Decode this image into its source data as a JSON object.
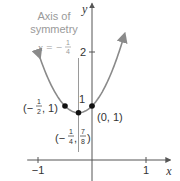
{
  "chart_data": {
    "type": "line",
    "title": "",
    "function": "y = 2x^2 + x + 1",
    "coefficients": {
      "a": 2,
      "b": 1,
      "c": 1
    },
    "xlabel": "x",
    "ylabel": "y",
    "xlim": [
      -1.2,
      1.45
    ],
    "ylim": [
      0,
      2.9
    ],
    "x_ticks": [
      {
        "value": -1,
        "label": "−1"
      },
      {
        "value": 1,
        "label": "1"
      }
    ],
    "y_ticks": [
      {
        "value": 1,
        "label": "1"
      },
      {
        "value": 2,
        "label": "2"
      }
    ],
    "curve_domain": [
      -0.97,
      0.6
    ],
    "grid": false,
    "axis_of_symmetry": {
      "x": -0.25,
      "title_line1": "Axis of",
      "title_line2": "symmetry",
      "equation_prefix": "x = −",
      "equation_num": "1",
      "equation_den": "4"
    },
    "points": [
      {
        "x": -0.5,
        "y": 1,
        "label_prefix": "(−",
        "num": "1",
        "den": "2",
        "label_suffix": ", 1)"
      },
      {
        "x": -0.25,
        "y": 0.875,
        "label_prefix": "(−",
        "num": "1",
        "den": "4",
        "mid": ", ",
        "num2": "7",
        "den2": "8",
        "label_suffix": ")"
      },
      {
        "x": 0,
        "y": 1,
        "label": "(0, 1)"
      }
    ],
    "colors": {
      "curve": "#8a8a8a",
      "axes": "#555555",
      "annotation": "#9a9a9a",
      "points": "#111111"
    }
  }
}
